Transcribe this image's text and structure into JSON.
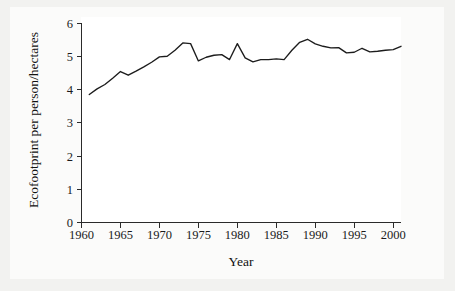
{
  "chart_data": {
    "type": "line",
    "title": "",
    "xlabel": "Year",
    "ylabel": "Ecofootprint per person/hectares",
    "xlim": [
      1960,
      2001
    ],
    "ylim": [
      0,
      6
    ],
    "xticks": [
      1960,
      1965,
      1970,
      1975,
      1980,
      1985,
      1990,
      1995,
      2000
    ],
    "yticks": [
      0,
      1,
      2,
      3,
      4,
      5,
      6
    ],
    "grid": false,
    "legend": null,
    "legend_position": "none",
    "series": [
      {
        "name": "Ecofootprint per person",
        "x": [
          1961,
          1962,
          1963,
          1964,
          1965,
          1966,
          1967,
          1968,
          1969,
          1970,
          1971,
          1972,
          1973,
          1974,
          1975,
          1976,
          1977,
          1978,
          1979,
          1980,
          1981,
          1982,
          1983,
          1984,
          1985,
          1986,
          1987,
          1988,
          1989,
          1990,
          1991,
          1992,
          1993,
          1994,
          1995,
          1996,
          1997,
          1998,
          1999,
          2000,
          2001
        ],
        "values": [
          3.85,
          4.02,
          4.15,
          4.34,
          4.54,
          4.43,
          4.55,
          4.68,
          4.82,
          4.98,
          5.0,
          5.18,
          5.4,
          5.38,
          4.86,
          4.97,
          5.03,
          5.05,
          4.9,
          5.38,
          4.95,
          4.83,
          4.9,
          4.9,
          4.92,
          4.9,
          5.18,
          5.42,
          5.51,
          5.37,
          5.3,
          5.25,
          5.26,
          5.1,
          5.12,
          5.24,
          5.13,
          5.15,
          5.18,
          5.2,
          5.3
        ]
      }
    ]
  },
  "axes": {
    "x_title": "Year",
    "y_title": "Ecofootprint per person/hectares",
    "x_tick_labels": [
      "1960",
      "1965",
      "1970",
      "1975",
      "1980",
      "1985",
      "1990",
      "1995",
      "2000"
    ],
    "y_tick_labels": [
      "0",
      "1",
      "2",
      "3",
      "4",
      "5",
      "6"
    ]
  },
  "colors": {
    "line": "#1c1c1c",
    "axis": "#2a2a2a",
    "plot_background": "#ffffff",
    "page_background": "#f2f2f0",
    "text": "#1a1a1a"
  }
}
